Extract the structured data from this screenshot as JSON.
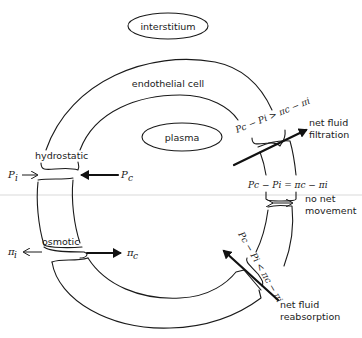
{
  "regions": {
    "interstitium": "interstitium",
    "plasma": "plasma",
    "endothelial_cell": "endothelial cell"
  },
  "forces": {
    "hydrostatic": "hydrostatic",
    "osmotic": "osmotic",
    "p_interstitial": "P",
    "p_interstitial_sub": "i",
    "p_capillary": "P",
    "p_capillary_sub": "c",
    "pi_interstitial": "π",
    "pi_interstitial_sub": "i",
    "pi_capillary": "π",
    "pi_capillary_sub": "c"
  },
  "conditions": {
    "filtration": {
      "equation": "Pc − Pi > πc − πi",
      "label_line1": "net fluid",
      "label_line2": "filtration"
    },
    "equilibrium": {
      "equation": "Pc − Pi = πc − πi",
      "label_line1": "no net",
      "label_line2": "movement"
    },
    "reabsorption": {
      "equation": "Pc − Pi < πc − πi",
      "label_line1": "net fluid",
      "label_line2": "reabsorption"
    }
  },
  "colors": {
    "ink": "#1a1a1a",
    "background": "#ffffff"
  }
}
